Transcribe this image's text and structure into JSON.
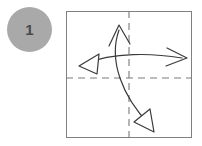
{
  "diagram": {
    "canvas": {
      "width": 202,
      "height": 146,
      "background": "#ffffff"
    },
    "step_badge": {
      "number": "1",
      "fill_color": "#a9a9a9",
      "text_color": "#4a4a4a",
      "shape": "circle",
      "diameter": 45
    },
    "paper": {
      "shape": "square",
      "fill_color": "#ffffff",
      "border_color": "#808080",
      "border_width": 1,
      "width": 126,
      "height": 127
    },
    "crease_lines": [
      {
        "name": "horizontal-crease",
        "style": "dashed",
        "color": "#7a7a7a",
        "orientation": "horizontal",
        "position_y": 67,
        "x1": 0,
        "x2": 126
      },
      {
        "name": "vertical-crease",
        "style": "dashed",
        "color": "#7a7a7a",
        "orientation": "vertical",
        "position_x": 63,
        "y1": 0,
        "y2": 127
      }
    ],
    "arrows": [
      {
        "name": "horizontal-double-arrow",
        "description": "curved double-headed arrow spanning left to right across the paper",
        "color": "#3a3a3a",
        "path": "M 15 54 C 45 41, 85 42, 117 46",
        "head_start": {
          "type": "open-triangle",
          "points": "15 54, 31 43, 30 62"
        },
        "head_end": {
          "type": "open-v",
          "points": "102 37, 119 46, 100 54"
        }
      },
      {
        "name": "vertical-double-arrow",
        "description": "curved double-headed arrow spanning top to bottom across the paper",
        "color": "#3a3a3a",
        "path": "M 53 18 C 44 48, 58 84, 84 112",
        "head_start": {
          "type": "open-v",
          "points": "44 34, 53 15, 63 33"
        },
        "head_end": {
          "type": "open-triangle",
          "points": "87 119, 70 110, 85 99"
        }
      }
    ]
  }
}
